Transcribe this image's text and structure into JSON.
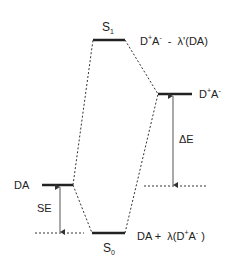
{
  "diagram": {
    "type": "energy-level-diagram",
    "levels": {
      "s1": {
        "label": "S",
        "sub": "1",
        "desc_main": "D",
        "desc_sup1": "+",
        "desc_mid": "A",
        "desc_sup2": "-",
        "desc_rest": "  -  λ'(DA)"
      },
      "cs": {
        "desc_main": "D",
        "desc_sup1": "+",
        "desc_mid": "A",
        "desc_sup2": "-"
      },
      "da": {
        "label": "DA"
      },
      "s0": {
        "label": "S",
        "sub": "0",
        "desc_pre": "DA +  λ(D",
        "desc_sup1": "+",
        "desc_mid": "A",
        "desc_sup2": "-",
        "desc_post": " )"
      }
    },
    "arrows": {
      "se": {
        "label": "SE"
      },
      "de": {
        "label": "ΔE"
      }
    },
    "colors": {
      "line": "#222222",
      "arrow": "#555555"
    }
  }
}
